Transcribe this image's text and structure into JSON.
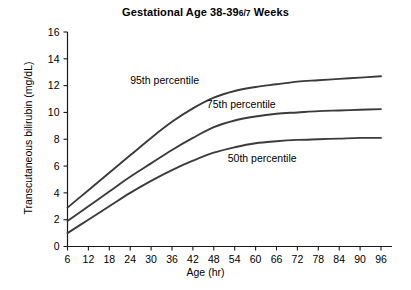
{
  "chart_data": {
    "type": "line",
    "title_main": "Gestational Age 38-39",
    "title_fraction": "6/7",
    "title_suffix": "Weeks",
    "xlabel": "Age (hr)",
    "ylabel": "Transcutaneous bilirubin (mg/dL)",
    "xlim": [
      6,
      96
    ],
    "ylim": [
      0,
      16
    ],
    "grid": false,
    "legend_position": "inline-labels",
    "xticks": [
      6,
      12,
      18,
      24,
      30,
      36,
      42,
      48,
      54,
      60,
      66,
      72,
      78,
      84,
      90,
      96
    ],
    "yticks": [
      0,
      2,
      4,
      6,
      8,
      10,
      12,
      14,
      16
    ],
    "x": [
      6,
      12,
      18,
      24,
      30,
      36,
      42,
      48,
      54,
      60,
      66,
      72,
      78,
      84,
      90,
      96
    ],
    "series": [
      {
        "name": "95th percentile",
        "color": "#3b3b3b",
        "label_x": 24,
        "label_y": 12.1,
        "values": [
          2.9,
          4.2,
          5.5,
          6.8,
          8.1,
          9.3,
          10.3,
          11.1,
          11.6,
          11.9,
          12.1,
          12.3,
          12.4,
          12.5,
          12.6,
          12.7
        ]
      },
      {
        "name": "75th percentile",
        "color": "#3b3b3b",
        "label_x": 46,
        "label_y": 10.3,
        "values": [
          1.9,
          3.0,
          4.1,
          5.2,
          6.2,
          7.2,
          8.1,
          8.9,
          9.4,
          9.7,
          9.9,
          10.0,
          10.1,
          10.15,
          10.2,
          10.25
        ]
      },
      {
        "name": "50th percentile",
        "color": "#3b3b3b",
        "label_x": 52,
        "label_y": 6.3,
        "values": [
          1.0,
          2.0,
          3.0,
          4.0,
          4.9,
          5.7,
          6.4,
          7.0,
          7.4,
          7.7,
          7.85,
          7.95,
          8.0,
          8.05,
          8.1,
          8.1
        ]
      }
    ]
  }
}
